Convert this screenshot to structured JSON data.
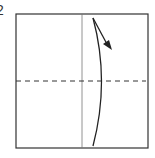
{
  "diagram": {
    "step_number": "2",
    "type": "origami-fold-step",
    "elements": [
      "square-paper",
      "vertical-crease",
      "horizontal-valley-fold-dashed",
      "curved-fold-arrow"
    ],
    "colors": {
      "line": "#222222",
      "crease": "#777777"
    }
  }
}
